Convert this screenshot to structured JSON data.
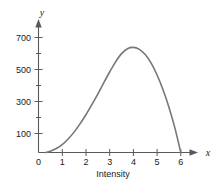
{
  "chart_data": {
    "type": "line",
    "title": "",
    "subtitle": "",
    "xlabel": "Intensity",
    "ylabel": "",
    "x_axis_var": "x",
    "y_axis_var": "y",
    "xlim": [
      0,
      6.4
    ],
    "ylim": [
      0,
      760
    ],
    "grid": false,
    "legend": false,
    "legend_position": "none",
    "x_ticks": [
      0,
      1,
      2,
      3,
      4,
      5,
      6
    ],
    "x_tick_labels": [
      "0",
      "1",
      "2",
      "3",
      "4",
      "5",
      "6"
    ],
    "y_ticks": [
      100,
      200,
      300,
      400,
      500,
      600,
      700
    ],
    "y_tick_labels": [
      "100",
      "",
      "300",
      "",
      "500",
      "",
      "700"
    ],
    "y_major_labels": [
      "100",
      "300",
      "500",
      "700"
    ],
    "series": [
      {
        "name": "intensity-curve",
        "color": "#777777",
        "x": [
          0.3,
          0.5,
          0.75,
          1.0,
          1.25,
          1.5,
          1.75,
          2.0,
          2.25,
          2.5,
          2.75,
          3.0,
          3.25,
          3.5,
          3.75,
          4.0,
          4.25,
          4.5,
          4.75,
          5.0,
          5.25,
          5.5,
          5.75,
          6.0
        ],
        "y": [
          0,
          8,
          24,
          48,
          82,
          124,
          174,
          230,
          292,
          356,
          424,
          490,
          552,
          602,
          632,
          640,
          628,
          596,
          544,
          472,
          382,
          276,
          150,
          0
        ]
      }
    ],
    "annotations": [],
    "peak": {
      "x": 4,
      "y": 640
    },
    "x_intercepts": [
      0.3,
      6.0
    ],
    "colors": {
      "curve": "#777777",
      "axis": "#595959",
      "text": "#1a1a1a",
      "background": "#ffffff"
    }
  }
}
